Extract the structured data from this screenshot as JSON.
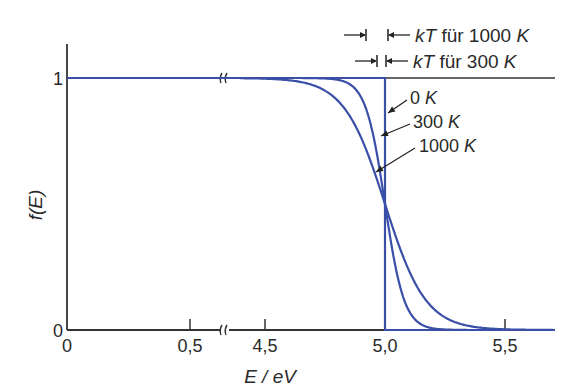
{
  "chart_data": {
    "type": "line",
    "title": "",
    "xlabel": "E / eV",
    "ylabel": "f(E)",
    "xlim_segments": [
      [
        0,
        0.6
      ],
      [
        4.4,
        5.7
      ]
    ],
    "axis_break": "between 0.5 and 4.5",
    "ylim": [
      0,
      1
    ],
    "x_ticks": [
      {
        "value": 0,
        "label": "0"
      },
      {
        "value": 0.5,
        "label": "0,5"
      },
      {
        "value": 4.5,
        "label": "4,5"
      },
      {
        "value": 5.0,
        "label": "5,0"
      },
      {
        "value": 5.5,
        "label": "5,5"
      }
    ],
    "y_ticks": [
      {
        "value": 0,
        "label": "0"
      },
      {
        "value": 1,
        "label": "1"
      }
    ],
    "fermi_energy_eV": 5.0,
    "series": [
      {
        "name": "0 K",
        "label": "0 K",
        "temperature_K": 0,
        "kind": "fermi-dirac"
      },
      {
        "name": "300 K",
        "label": "300 K",
        "temperature_K": 300,
        "kind": "fermi-dirac"
      },
      {
        "name": "1000 K",
        "label": "1000 K",
        "temperature_K": 1000,
        "kind": "fermi-dirac"
      }
    ],
    "annotations": [
      {
        "text_italic": "kT",
        "text": " für 1000 K",
        "id": "kt1000"
      },
      {
        "text_italic": "kT",
        "text": " für 300 K",
        "id": "kt300"
      }
    ],
    "grid": false,
    "line_color": "#3a4fa8"
  }
}
